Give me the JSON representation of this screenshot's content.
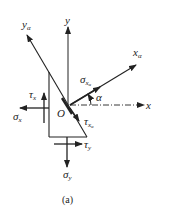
{
  "figure": {
    "caption": "(a)",
    "axes": {
      "x": "x",
      "y": "y",
      "x_alpha": "x",
      "x_alpha_sub": "α",
      "y_alpha": "y",
      "y_alpha_sub": "α"
    },
    "origin": "O",
    "angle": "α",
    "stresses": {
      "sigma_x": {
        "sym": "σ",
        "sub": "x"
      },
      "tau_x": {
        "sym": "τ",
        "sub": "x"
      },
      "sigma_y": {
        "sym": "σ",
        "sub": "y"
      },
      "tau_y": {
        "sym": "τ",
        "sub": "y"
      },
      "sigma_xa": {
        "sym": "σ",
        "sub": "x",
        "subsub": "α"
      },
      "tau_xa": {
        "sym": "τ",
        "sub": "x",
        "subsub": "α"
      }
    },
    "line_color": "#222222"
  }
}
